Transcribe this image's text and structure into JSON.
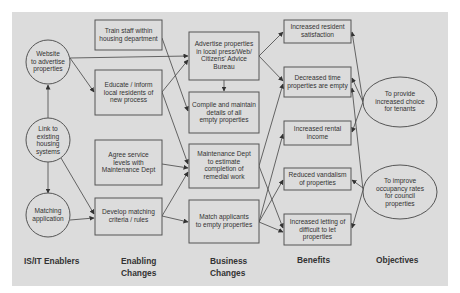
{
  "diagram": {
    "columns": [
      {
        "id": "enablers",
        "label_lines": [
          "IS/IT Enablers"
        ]
      },
      {
        "id": "enabling",
        "label_lines": [
          "Enabling",
          "Changes"
        ]
      },
      {
        "id": "business",
        "label_lines": [
          "Business",
          "Changes"
        ]
      },
      {
        "id": "benefits",
        "label_lines": [
          "Benefits"
        ]
      },
      {
        "id": "objectives",
        "label_lines": [
          "Objectives"
        ]
      }
    ],
    "nodes": {
      "website": {
        "shape": "circle",
        "lines": [
          "Website",
          "to advertise",
          "properties"
        ]
      },
      "link": {
        "shape": "circle",
        "lines": [
          "Link to",
          "existing",
          "housing",
          "systems"
        ]
      },
      "matching": {
        "shape": "circle",
        "lines": [
          "Matching",
          "application"
        ]
      },
      "train": {
        "shape": "box",
        "lines": [
          "Train staff within",
          "housing department"
        ]
      },
      "educate": {
        "shape": "box",
        "lines": [
          "Educate / inform",
          "local residents of",
          "new process"
        ]
      },
      "agree": {
        "shape": "box",
        "lines": [
          "Agree service",
          "levels with",
          "Maintenance Dept"
        ]
      },
      "develop": {
        "shape": "box",
        "lines": [
          "Develop matching",
          "criteria / rules"
        ]
      },
      "advertise": {
        "shape": "box",
        "lines": [
          "Advertise properties",
          "in local press/Web/",
          "Citizens' Advice",
          "Bureau"
        ]
      },
      "compile": {
        "shape": "box",
        "lines": [
          "Compile and maintain",
          "details of all",
          "empty properties"
        ]
      },
      "maintenance": {
        "shape": "box",
        "lines": [
          "Maintenance Dept",
          "to estimate",
          "completion of",
          "remedial work"
        ]
      },
      "match": {
        "shape": "box",
        "lines": [
          "Match applicants",
          "to empty properties"
        ]
      },
      "satisfaction": {
        "shape": "box",
        "lines": [
          "Increased resident",
          "satisfaction"
        ]
      },
      "decreased": {
        "shape": "box",
        "lines": [
          "Decreased  time",
          "properties are empty"
        ]
      },
      "rental": {
        "shape": "box",
        "lines": [
          "Increased rental",
          "income"
        ]
      },
      "vandalism": {
        "shape": "box",
        "lines": [
          "Reduced vandalism",
          "of properties"
        ]
      },
      "letting": {
        "shape": "box",
        "lines": [
          "Increased letting of",
          "difficult to let",
          "properties"
        ]
      },
      "choice": {
        "shape": "ellipse",
        "lines": [
          "To provide",
          "increased choice",
          "for tenants"
        ]
      },
      "occupancy": {
        "shape": "ellipse",
        "lines": [
          "To improve",
          "occupancy rates",
          "for council",
          "properties"
        ]
      }
    },
    "edges": [
      [
        "link",
        "website"
      ],
      [
        "link",
        "matching"
      ],
      [
        "link",
        "develop"
      ],
      [
        "website",
        "educate"
      ],
      [
        "website",
        "advertise"
      ],
      [
        "matching",
        "develop"
      ],
      [
        "train",
        "compile"
      ],
      [
        "educate",
        "advertise"
      ],
      [
        "educate",
        "maintenance"
      ],
      [
        "agree",
        "maintenance"
      ],
      [
        "develop",
        "maintenance"
      ],
      [
        "develop",
        "match"
      ],
      [
        "advertise",
        "compile"
      ],
      [
        "advertise",
        "satisfaction"
      ],
      [
        "advertise",
        "decreased"
      ],
      [
        "maintenance",
        "decreased"
      ],
      [
        "maintenance",
        "letting"
      ],
      [
        "match",
        "rental"
      ],
      [
        "match",
        "vandalism"
      ],
      [
        "match",
        "letting"
      ],
      [
        "choice",
        "satisfaction"
      ],
      [
        "choice",
        "decreased"
      ],
      [
        "choice",
        "rental"
      ],
      [
        "occupancy",
        "decreased"
      ],
      [
        "occupancy",
        "vandalism"
      ],
      [
        "occupancy",
        "letting"
      ]
    ],
    "colors": {
      "panel": "#dcdcdc",
      "stroke": "#555555",
      "text": "#333333"
    }
  }
}
